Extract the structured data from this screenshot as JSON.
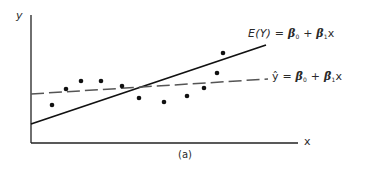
{
  "chart_data": {
    "type": "scatter",
    "title": "",
    "caption": "(a)",
    "xlabel": "x",
    "ylabel": "y",
    "grid": false,
    "ticks": "none",
    "colors": {
      "axis": "#222222",
      "true_line": "#111111",
      "fitted_line": "#555555",
      "points": "#111111",
      "text": "#2a2a2a"
    },
    "points_px": [
      [
        52,
        105
      ],
      [
        66,
        89
      ],
      [
        81,
        81
      ],
      [
        101,
        81
      ],
      [
        122,
        86
      ],
      [
        139,
        98
      ],
      [
        164,
        102
      ],
      [
        187,
        96
      ],
      [
        204,
        88
      ],
      [
        217,
        73
      ],
      [
        223,
        53
      ]
    ],
    "series": [
      {
        "name": "E(Y) = β0 + β1x",
        "style": "solid",
        "from_px": [
          31,
          124
        ],
        "to_px": [
          266,
          45
        ]
      },
      {
        "name": "ŷ = β̂0 + β̂1x",
        "style": "dashed",
        "from_px": [
          31,
          94
        ],
        "to_px": [
          268,
          79
        ]
      }
    ],
    "legend": {
      "true_line_label": {
        "E": "E(Y)",
        "eq": "=",
        "b0": "β",
        "b0_sub": "0",
        "plus": "+",
        "b1": "β",
        "b1_sub": "1",
        "x": "x"
      },
      "fitted_line_label": {
        "yhat": "ŷ",
        "eq": "=",
        "b0": "β̂",
        "b0_sub": "0",
        "plus": "+",
        "b1": "β̂",
        "b1_sub": "1",
        "x": "x"
      }
    },
    "axes": {
      "origin_px": [
        31,
        143
      ],
      "y_top_px": 15,
      "x_right_px": 298
    }
  }
}
